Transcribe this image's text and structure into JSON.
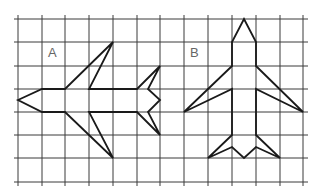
{
  "figure": {
    "labels": [
      {
        "id": "A",
        "text": "A",
        "x": 48,
        "y": 45
      },
      {
        "id": "B",
        "text": "B",
        "x": 190,
        "y": 45
      }
    ],
    "grid": {
      "x_lines": [
        18,
        42,
        65,
        89,
        113,
        137,
        160,
        184,
        208,
        232,
        256,
        280,
        303
      ],
      "y_lines": [
        19,
        42,
        66,
        89,
        112,
        135,
        158,
        182
      ],
      "x_extent": [
        14,
        308
      ],
      "y_extent": [
        15,
        186
      ],
      "color": "#3a3a3a"
    },
    "shapes": [
      {
        "name": "plane-a",
        "orientation": "horizontal",
        "points": [
          [
            18,
            100
          ],
          [
            42,
            89
          ],
          [
            65,
            89
          ],
          [
            113,
            42
          ],
          [
            89,
            89
          ],
          [
            137,
            89
          ],
          [
            160,
            66
          ],
          [
            148,
            89
          ],
          [
            160,
            100
          ],
          [
            148,
            112
          ],
          [
            160,
            135
          ],
          [
            137,
            112
          ],
          [
            89,
            112
          ],
          [
            113,
            158
          ],
          [
            65,
            112
          ],
          [
            42,
            112
          ]
        ]
      },
      {
        "name": "plane-b",
        "orientation": "vertical",
        "points": [
          [
            244,
            19
          ],
          [
            256,
            42
          ],
          [
            256,
            66
          ],
          [
            303,
            112
          ],
          [
            256,
            89
          ],
          [
            256,
            135
          ],
          [
            280,
            158
          ],
          [
            256,
            147
          ],
          [
            244,
            158
          ],
          [
            232,
            147
          ],
          [
            208,
            158
          ],
          [
            232,
            135
          ],
          [
            232,
            89
          ],
          [
            184,
            112
          ],
          [
            232,
            66
          ],
          [
            232,
            42
          ]
        ]
      }
    ],
    "stroke_color": "#1a1a1a"
  }
}
